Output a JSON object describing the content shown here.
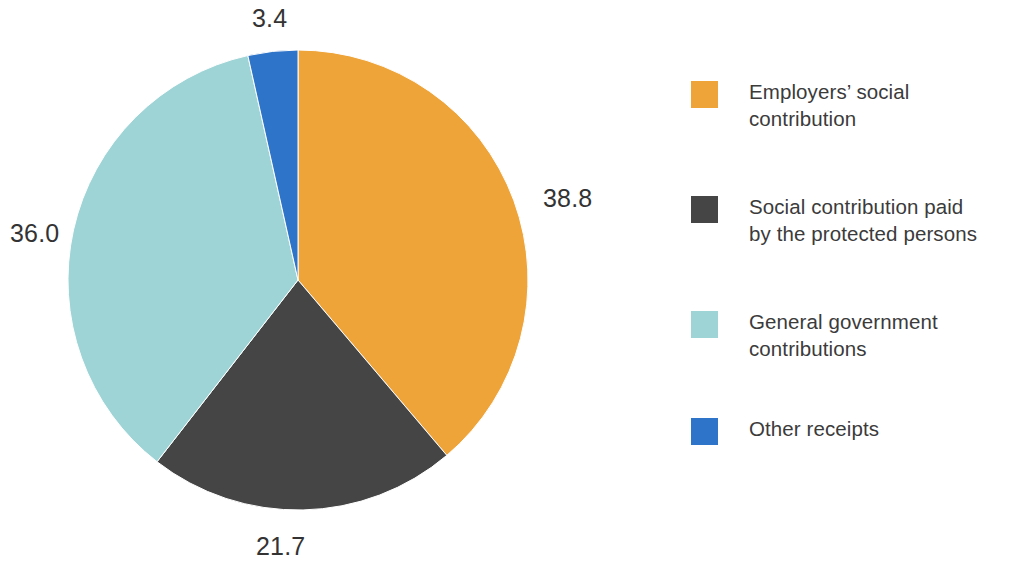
{
  "chart_data": {
    "type": "pie",
    "title": "",
    "subtitle": "",
    "xlabel": "",
    "ylabel": "",
    "grid": false,
    "legend_position": "right",
    "start_angle_deg": 0,
    "direction": "clockwise",
    "unit": "percent",
    "categories": [
      "Employers' social contribution",
      "Social contribution paid by the protected persons",
      "General government contributions",
      "Other receipts"
    ],
    "values": [
      38.8,
      21.7,
      36.0,
      3.4
    ],
    "colors": [
      "#efa43a",
      "#454545",
      "#9fd4d6",
      "#2e74c8"
    ],
    "slices": [
      {
        "name": "Employers' social contribution",
        "value": 38.8,
        "label": "38.8",
        "color": "#efa43a",
        "start_deg": 0,
        "end_deg": 139.68
      },
      {
        "name": "Social contribution paid by the protected persons",
        "value": 21.7,
        "label": "21.7",
        "color": "#454545",
        "start_deg": 139.68,
        "end_deg": 217.8
      },
      {
        "name": "General government contributions",
        "value": 36.0,
        "label": "36.0",
        "color": "#9fd4d6",
        "start_deg": 217.8,
        "end_deg": 347.4
      },
      {
        "name": "Other receipts",
        "value": 3.4,
        "label": "3.4",
        "color": "#2e74c8",
        "start_deg": 347.4,
        "end_deg": 360
      }
    ]
  },
  "labels": {
    "other_receipts": "3.4",
    "employers": "38.8",
    "government": "36.0",
    "protected_persons": "21.7"
  },
  "legend": {
    "items": [
      {
        "label": "Employers’ social\ncontribution",
        "color": "#efa43a",
        "swatch_name": "legend-swatch-employers"
      },
      {
        "label": "Social contribution paid\nby the protected persons",
        "color": "#454545",
        "swatch_name": "legend-swatch-protected-persons"
      },
      {
        "label": "General government\ncontributions",
        "color": "#9fd4d6",
        "swatch_name": "legend-swatch-government"
      },
      {
        "label": "Other receipts",
        "color": "#2e74c8",
        "swatch_name": "legend-swatch-other-receipts"
      }
    ]
  }
}
